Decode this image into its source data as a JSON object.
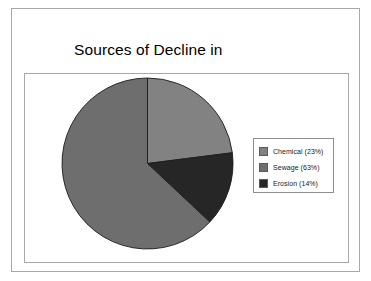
{
  "chart_data": {
    "type": "pie",
    "title": "Sources of Decline in Water Quality Index",
    "title_lines": [
      "Sources of Decline in",
      "Water Quality Index"
    ],
    "categories": [
      "Chemical",
      "Sewage",
      "Erosion"
    ],
    "values": [
      23,
      63,
      14
    ],
    "unit": "%",
    "legend_position": "right",
    "grid": false,
    "start_angle_deg": 0,
    "direction": "clockwise",
    "slices": [
      {
        "label": "Chemical",
        "value": 23,
        "legend_text": "Chemical (23%)",
        "color": "#828282",
        "start_deg": 0,
        "end_deg": 82.8
      },
      {
        "label": "Sewage",
        "value": 63,
        "legend_text": "Sewage (63%)",
        "color": "#6e6e6e",
        "start_deg": 133.2,
        "end_deg": 360
      },
      {
        "label": "Erosion",
        "value": 14,
        "legend_text": "Erosion (14%)",
        "color": "#262626",
        "start_deg": 82.8,
        "end_deg": 133.2
      }
    ]
  },
  "legend": {
    "items": [
      {
        "label": "Chemical (23%)",
        "color": "#828282"
      },
      {
        "label": "Sewage (63%)",
        "color": "#6e6e6e"
      },
      {
        "label": "Erosion (14%)",
        "color": "#262626"
      }
    ]
  },
  "colors": {
    "frame_border": "#a8a8a8",
    "plot_border": "#a8a8a8",
    "legend_border": "#8f8f8f",
    "slice_outline": "#1c1c1c",
    "background": "#ffffff",
    "text": "#000000"
  }
}
